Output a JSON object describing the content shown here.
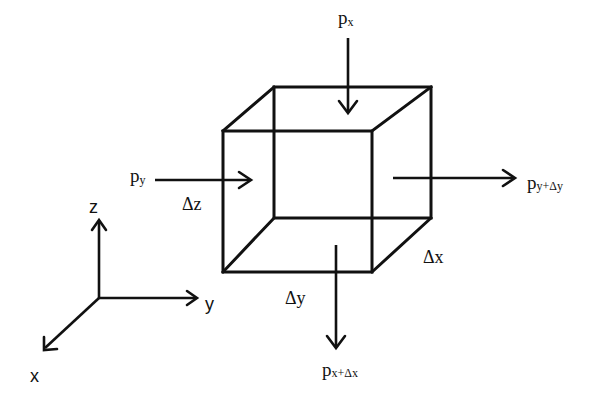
{
  "diagram": {
    "type": "control-volume-cube",
    "colors": {
      "stroke": "#111111",
      "background": "#ffffff"
    },
    "cube": {
      "front_face": {
        "x1": 223,
        "y1": 131,
        "x2": 372,
        "y2": 272
      },
      "back_face": {
        "x1": 274,
        "y1": 87,
        "x2": 431,
        "y2": 218
      },
      "dimension_labels": {
        "dz": "Δz",
        "dy": "Δy",
        "dx": "Δx"
      }
    },
    "forces": {
      "px": {
        "main": "p",
        "sub": "x"
      },
      "py": {
        "main": "p",
        "sub": "y"
      },
      "py_dy": {
        "main": "p",
        "sub": "y+Δy"
      },
      "px_dx": {
        "main": "p",
        "sub": "x+Δx"
      }
    },
    "axes": {
      "z_label": "z",
      "y_label": "y",
      "x_label": "x"
    }
  }
}
